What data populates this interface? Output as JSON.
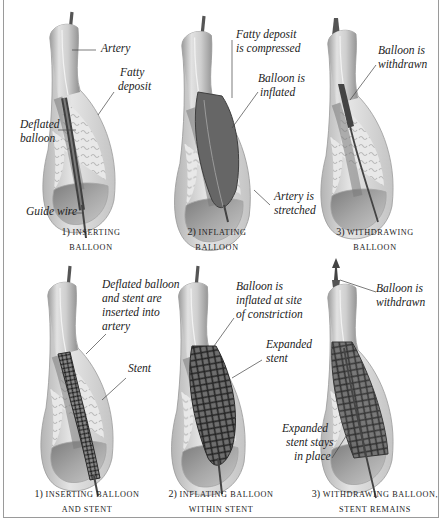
{
  "figure": {
    "title_fragment": "",
    "rows": [
      {
        "name": "balloon-angioplasty",
        "panels": [
          {
            "step": "1)",
            "caption_line1": "Inserting",
            "caption_line2": "Balloon",
            "labels": [
              "Artery",
              "Fatty",
              "deposit",
              "Deflated",
              "balloon",
              "Guide wire"
            ]
          },
          {
            "step": "2)",
            "caption_line1": "Inflating",
            "caption_line2": "Balloon",
            "labels": [
              "Fatty deposit",
              "is compressed",
              "Balloon is",
              "inflated",
              "Artery is",
              "stretched"
            ]
          },
          {
            "step": "3)",
            "caption_line1": "Withdrawing",
            "caption_line2": "Balloon",
            "labels": [
              "Balloon is",
              "withdrawn"
            ]
          }
        ]
      },
      {
        "name": "stent-placement",
        "panels": [
          {
            "step": "1)",
            "caption_line1": "Inserting balloon",
            "caption_line2": "and stent",
            "labels": [
              "Deflated balloon",
              "and stent are",
              "inserted into",
              "artery",
              "Stent"
            ]
          },
          {
            "step": "2)",
            "caption_line1": "Inflating balloon",
            "caption_line2": "within stent",
            "labels": [
              "Balloon is",
              "inflated at site",
              "of constriction",
              "Expanded",
              "stent"
            ]
          },
          {
            "step": "3)",
            "caption_line1": "Withdrawing balloon,",
            "caption_line2": "stent remains",
            "labels": [
              "Balloon is",
              "withdrawn",
              "Expanded",
              "stent stays",
              "in place"
            ]
          }
        ]
      }
    ],
    "colors": {
      "border": "#9a9a9a",
      "artery_outer": "#d6d6d6",
      "artery_wall": "#bdbdbd",
      "lumen": "#8a8a8a",
      "deposit": "#ececec",
      "balloon": "#5a5a5a",
      "wire": "#4a4a4a",
      "stent": "#2e2e2e",
      "text": "#222222"
    }
  }
}
